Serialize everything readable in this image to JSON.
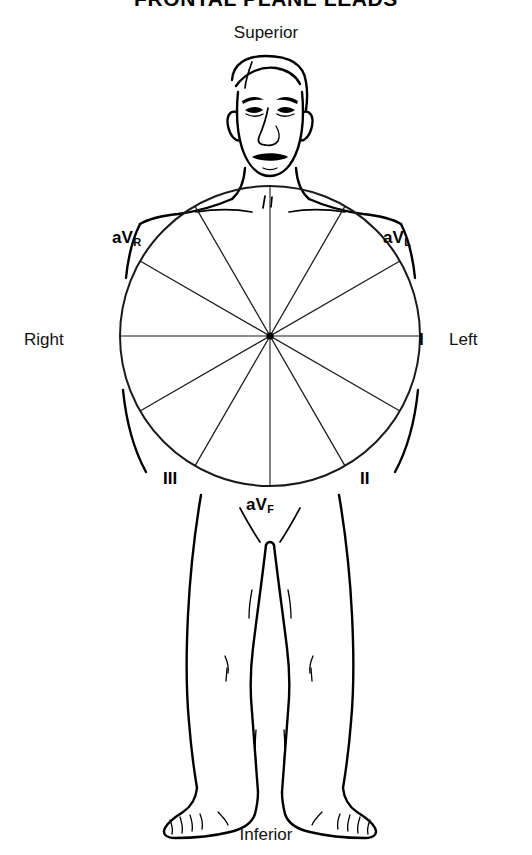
{
  "figure": {
    "title": "FRONTAL PLANE LEADS",
    "orientation": {
      "superior": "Superior",
      "inferior": "Inferior",
      "right": "Right",
      "left": "Left"
    },
    "leads": [
      {
        "id": "aVR",
        "base": "aV",
        "sub": "R",
        "angle_deg": -150,
        "label": "aVR"
      },
      {
        "id": "aVL",
        "base": "aV",
        "sub": "L",
        "angle_deg": -30,
        "label": "aVL"
      },
      {
        "id": "I",
        "base": "I",
        "sub": "",
        "angle_deg": 0,
        "label": "I"
      },
      {
        "id": "II",
        "base": "II",
        "sub": "",
        "angle_deg": 60,
        "label": "II"
      },
      {
        "id": "III",
        "base": "III",
        "sub": "",
        "angle_deg": 120,
        "label": "III"
      },
      {
        "id": "aVF",
        "base": "aV",
        "sub": "F",
        "angle_deg": 90,
        "label": "aVF"
      }
    ],
    "wheel": {
      "center_x": 270,
      "center_y": 336,
      "radius": 150,
      "spoke_count": 12,
      "spoke_step_deg": 30
    },
    "colors": {
      "ink": "#000000",
      "background": "#ffffff",
      "wheel": "#1a1a1a"
    }
  }
}
